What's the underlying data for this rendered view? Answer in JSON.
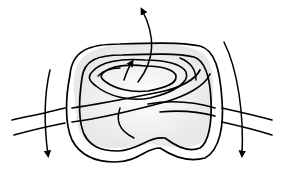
{
  "figure": {
    "type": "knot-illustration",
    "colors": {
      "line": "#000000",
      "background": "#ffffff",
      "shade": "#e6e6e6"
    },
    "arrows": [
      {
        "name": "left-down",
        "direction": "down"
      },
      {
        "name": "right-down",
        "direction": "down"
      },
      {
        "name": "top-up",
        "direction": "up-left"
      },
      {
        "name": "center-up",
        "direction": "up"
      }
    ]
  }
}
